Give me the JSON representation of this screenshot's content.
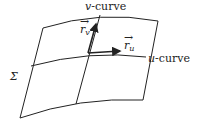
{
  "labels": {
    "v_curve": "v-curve",
    "u_curve": "u-curve",
    "surface": "Σ",
    "r_v": "r",
    "r_v_sub": "v",
    "r_u": "r",
    "r_u_sub": "u"
  },
  "colors": {
    "stroke": "#222222",
    "background": "#ffffff"
  }
}
